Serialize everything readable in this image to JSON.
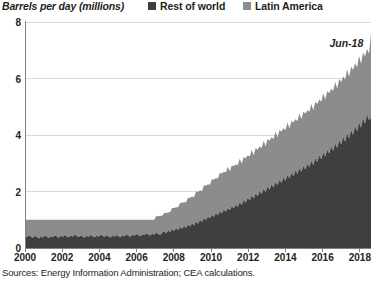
{
  "chart_data": {
    "type": "area",
    "stacked": true,
    "title": "",
    "ylabel": "Barrels per day (millions)",
    "xlabel": "",
    "ylim": [
      0,
      8
    ],
    "yticks": [
      0,
      2,
      4,
      6,
      8
    ],
    "xlim": [
      2000,
      2018.6
    ],
    "xticks": [
      2000,
      2002,
      2004,
      2006,
      2008,
      2010,
      2012,
      2014,
      2016,
      2018
    ],
    "grid": true,
    "grid_axis": "y",
    "legend_position": "top-right",
    "colors": {
      "rest_of_world": "#3f3f3f",
      "latin_america": "#8c8c8c",
      "gridline": "#d9d9d9",
      "axis": "#808080",
      "text": "#231f20",
      "background": "#ffffff"
    },
    "annotations": [
      {
        "text": "Jun-18",
        "x": 2017.55,
        "y": 7.25
      }
    ],
    "series": [
      {
        "name": "Rest of world",
        "color": "#3f3f3f",
        "values": [
          0.42,
          0.38,
          0.45,
          0.4,
          0.36,
          0.43,
          0.39,
          0.34,
          0.41,
          0.37,
          0.44,
          0.4,
          0.35,
          0.42,
          0.38,
          0.45,
          0.41,
          0.36,
          0.43,
          0.39,
          0.46,
          0.42,
          0.37,
          0.44,
          0.4,
          0.47,
          0.43,
          0.38,
          0.45,
          0.41,
          0.36,
          0.43,
          0.39,
          0.46,
          0.42,
          0.38,
          0.44,
          0.4,
          0.47,
          0.43,
          0.39,
          0.45,
          0.41,
          0.37,
          0.44,
          0.4,
          0.46,
          0.42,
          0.38,
          0.45,
          0.41,
          0.48,
          0.44,
          0.4,
          0.47,
          0.43,
          0.5,
          0.46,
          0.42,
          0.49,
          0.45,
          0.52,
          0.48,
          0.44,
          0.51,
          0.47,
          0.55,
          0.5,
          0.46,
          0.54,
          0.58,
          0.52,
          0.62,
          0.57,
          0.66,
          0.6,
          0.7,
          0.64,
          0.74,
          0.68,
          0.78,
          0.72,
          0.82,
          0.76,
          0.88,
          0.8,
          0.94,
          0.86,
          1.0,
          0.92,
          1.06,
          0.98,
          1.12,
          1.04,
          1.18,
          1.1,
          1.24,
          1.16,
          1.3,
          1.22,
          1.36,
          1.28,
          1.42,
          1.34,
          1.48,
          1.4,
          1.54,
          1.46,
          1.62,
          1.52,
          1.7,
          1.6,
          1.78,
          1.68,
          1.86,
          1.74,
          1.94,
          1.82,
          2.02,
          1.9,
          2.1,
          1.98,
          2.18,
          2.06,
          2.26,
          2.14,
          2.34,
          2.22,
          2.42,
          2.3,
          2.5,
          2.38,
          2.58,
          2.46,
          2.66,
          2.54,
          2.74,
          2.62,
          2.82,
          2.7,
          2.9,
          2.78,
          2.98,
          2.86,
          3.08,
          2.94,
          3.18,
          3.04,
          3.28,
          3.14,
          3.38,
          3.24,
          3.48,
          3.34,
          3.58,
          3.44,
          3.7,
          3.54,
          3.82,
          3.66,
          3.94,
          3.76,
          4.06,
          3.88,
          4.18,
          4.0,
          4.32,
          4.12,
          4.46,
          4.26,
          4.6,
          4.4,
          4.74,
          4.52,
          4.62
        ]
      },
      {
        "name": "Latin America",
        "color": "#8c8c8c",
        "values": [
          0.58,
          0.62,
          0.55,
          0.6,
          0.64,
          0.57,
          0.61,
          0.66,
          0.59,
          0.63,
          0.56,
          0.6,
          0.65,
          0.58,
          0.62,
          0.55,
          0.59,
          0.64,
          0.57,
          0.61,
          0.54,
          0.58,
          0.63,
          0.56,
          0.6,
          0.53,
          0.57,
          0.62,
          0.55,
          0.59,
          0.64,
          0.57,
          0.61,
          0.54,
          0.58,
          0.62,
          0.56,
          0.6,
          0.53,
          0.57,
          0.61,
          0.55,
          0.59,
          0.63,
          0.56,
          0.6,
          0.54,
          0.58,
          0.62,
          0.55,
          0.59,
          0.52,
          0.56,
          0.6,
          0.53,
          0.57,
          0.5,
          0.54,
          0.58,
          0.51,
          0.55,
          0.48,
          0.52,
          0.56,
          0.49,
          0.53,
          0.58,
          0.62,
          0.68,
          0.6,
          0.66,
          0.72,
          0.64,
          0.7,
          0.76,
          0.82,
          0.74,
          0.8,
          0.86,
          0.92,
          0.84,
          0.9,
          0.96,
          1.02,
          0.94,
          1.0,
          1.06,
          1.12,
          1.04,
          1.1,
          1.16,
          1.22,
          1.14,
          1.2,
          1.26,
          1.32,
          1.24,
          1.3,
          1.36,
          1.42,
          1.34,
          1.4,
          1.46,
          1.38,
          1.44,
          1.5,
          1.42,
          1.48,
          1.54,
          1.46,
          1.52,
          1.58,
          1.5,
          1.56,
          1.62,
          1.54,
          1.6,
          1.66,
          1.58,
          1.64,
          1.7,
          1.62,
          1.68,
          1.74,
          1.66,
          1.72,
          1.78,
          1.7,
          1.76,
          1.82,
          1.74,
          1.8,
          1.86,
          1.78,
          1.84,
          1.9,
          1.82,
          1.88,
          1.94,
          1.86,
          1.92,
          1.98,
          1.9,
          1.96,
          2.02,
          1.94,
          2.0,
          2.06,
          1.98,
          2.04,
          2.1,
          2.02,
          2.08,
          2.14,
          2.06,
          2.12,
          2.18,
          2.1,
          2.16,
          2.22,
          2.14,
          2.2,
          2.26,
          2.18,
          2.24,
          2.3,
          2.22,
          2.28,
          2.34,
          2.26,
          2.32,
          2.38,
          2.3,
          2.36,
          2.98
        ]
      }
    ]
  },
  "legend": {
    "items": [
      {
        "label": "Rest of world",
        "color": "#3f3f3f"
      },
      {
        "label": "Latin America",
        "color": "#8c8c8c"
      }
    ]
  },
  "axis_title": "Barrels per day (millions)",
  "annotation_label": "Jun-18",
  "source_note": "Sources: Energy Information Administration; CEA calculations.",
  "ytick_labels": [
    "8",
    "6",
    "4",
    "2",
    "0"
  ],
  "xtick_labels": [
    "2000",
    "2002",
    "2004",
    "2006",
    "2008",
    "2010",
    "2012",
    "2014",
    "2016",
    "2018"
  ]
}
